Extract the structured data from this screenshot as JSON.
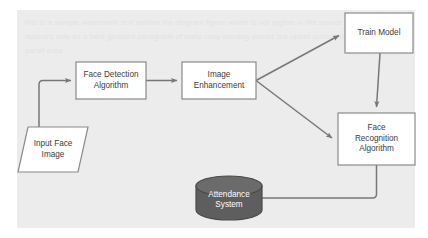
{
  "diagram": {
    "background_color": "#ececed",
    "page_color": "#ffffff",
    "node_fill": "#ffffff",
    "node_stroke": "#8a8a8a",
    "database_fill": "#5e5e5e",
    "database_stroke": "#4a4a4a",
    "connector_color": "#77777a",
    "text_color": "#3c3c3c",
    "database_text_color": "#ffffff",
    "watermark_text": "this is a sample watermark text behind the diagram figure which is not legible in the source screenshot and appears only as a faint ghosted paragraph of body copy running across the upper portion of the gray canvas panel area"
  },
  "nodes": [
    {
      "id": "input-face-image",
      "name": "input-face-image-node",
      "label": "Input Face\nImage",
      "shape": "parallelogram",
      "x": 18,
      "y": 127,
      "width": 70,
      "height": 45
    },
    {
      "id": "face-detection-algorithm",
      "name": "face-detection-algorithm-node",
      "label": "Face Detection\nAlgorithm",
      "shape": "rectangle",
      "x": 76,
      "y": 62,
      "width": 70,
      "height": 37
    },
    {
      "id": "image-enhancement",
      "name": "image-enhancement-node",
      "label": "Image\nEnhancement",
      "shape": "rectangle",
      "x": 182,
      "y": 62,
      "width": 74,
      "height": 37
    },
    {
      "id": "train-model",
      "name": "train-model-node",
      "label": "Train Model",
      "shape": "rectangle",
      "x": 345,
      "y": 13,
      "width": 68,
      "height": 40
    },
    {
      "id": "face-recognition-algorithm",
      "name": "face-recognition-algorithm-node",
      "label": "Face\nRecognition\nAlgorithm",
      "shape": "rectangle",
      "x": 338,
      "y": 113,
      "width": 77,
      "height": 52
    },
    {
      "id": "attendance-system",
      "name": "attendance-system-database-node",
      "label": "Attendance\nSystem",
      "shape": "cylinder",
      "x": 196,
      "y": 176,
      "width": 66,
      "height": 44
    }
  ],
  "connectors": [
    {
      "id": "input-to-detection",
      "name": "connector-input-to-face-detection",
      "from": "input-face-image",
      "to": "face-detection-algorithm",
      "arrowhead": true
    },
    {
      "id": "detection-to-enhancement",
      "name": "connector-face-detection-to-image-enhancement",
      "from": "face-detection-algorithm",
      "to": "image-enhancement",
      "arrowhead": true
    },
    {
      "id": "enhancement-to-train",
      "name": "connector-image-enhancement-to-train-model",
      "from": "image-enhancement",
      "to": "train-model",
      "arrowhead": true
    },
    {
      "id": "enhancement-to-recognition",
      "name": "connector-image-enhancement-to-face-recognition",
      "from": "image-enhancement",
      "to": "face-recognition-algorithm",
      "arrowhead": true
    },
    {
      "id": "train-to-recognition",
      "name": "connector-train-model-to-face-recognition",
      "from": "train-model",
      "to": "face-recognition-algorithm",
      "arrowhead": true
    },
    {
      "id": "recognition-to-attendance",
      "name": "connector-face-recognition-to-attendance-system",
      "from": "face-recognition-algorithm",
      "to": "attendance-system",
      "arrowhead": false
    }
  ]
}
